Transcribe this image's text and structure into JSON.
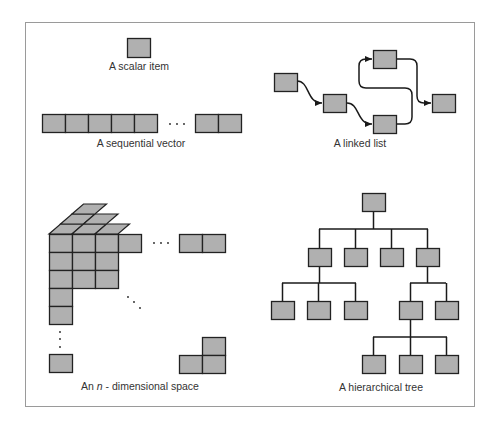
{
  "colors": {
    "cell_fill": "#b0b0b0",
    "cell_stroke": "#222222",
    "line": "#1a1a1a",
    "frame": "#9a9a9a",
    "text": "#333333"
  },
  "panels": {
    "scalar": {
      "label": "A scalar item",
      "cells": 1
    },
    "vector": {
      "label": "A sequential vector",
      "leading_cells": 5,
      "trailing_cells": 2,
      "ellipsis": "· · ·"
    },
    "linked_list": {
      "label": "A linked list",
      "nodes": 5
    },
    "nspace": {
      "label_prefix": "An ",
      "label_var": "n",
      "label_suffix": " - dimensional space"
    },
    "tree": {
      "label": "A hierarchical tree",
      "structure": {
        "root": [
          "a",
          "b",
          "c",
          "d"
        ],
        "a": [
          "a1",
          "a2",
          "a3"
        ],
        "d": [
          "d1",
          "d2"
        ],
        "d1": [
          "d1a",
          "d1b",
          "d1c"
        ]
      }
    }
  }
}
